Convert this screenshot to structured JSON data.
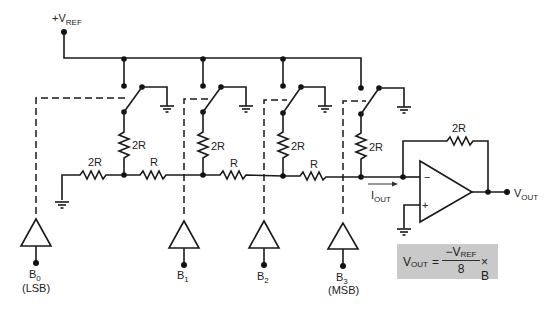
{
  "diagram": {
    "reference": {
      "label": "+V",
      "sub": "REF"
    },
    "resistors": {
      "termination": "2R",
      "shunt": [
        "2R",
        "2R",
        "2R",
        "2R"
      ],
      "series": [
        "R",
        "R",
        "R"
      ],
      "feedback": "2R"
    },
    "current": {
      "label": "I",
      "sub": "OUT"
    },
    "output": {
      "label": "V",
      "sub": "OUT"
    },
    "opamp": {
      "inverting": "−",
      "noninverting": "+"
    },
    "bits": [
      {
        "label": "B",
        "sub": "0",
        "note": "(LSB)"
      },
      {
        "label": "B",
        "sub": "1",
        "note": ""
      },
      {
        "label": "B",
        "sub": "2",
        "note": ""
      },
      {
        "label": "B",
        "sub": "3",
        "note": "(MSB)"
      }
    ],
    "formula": {
      "lhs": "V",
      "lhs_sub": "OUT",
      "equals": "=",
      "numerator": "−V",
      "numerator_sub": "REF",
      "denominator": "8",
      "times": "× B"
    },
    "colors": {
      "line": "#1a1a1a",
      "formula_bg": "#c9c9c9",
      "background": "#ffffff"
    }
  }
}
